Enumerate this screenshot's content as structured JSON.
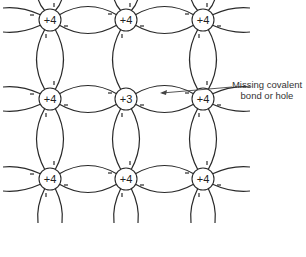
{
  "diagram": {
    "title": "",
    "atoms": [
      {
        "row": 0,
        "col": 0,
        "label": "+4"
      },
      {
        "row": 0,
        "col": 1,
        "label": "+4"
      },
      {
        "row": 0,
        "col": 2,
        "label": "+4"
      },
      {
        "row": 1,
        "col": 0,
        "label": "+4"
      },
      {
        "row": 1,
        "col": 1,
        "label": "+3"
      },
      {
        "row": 1,
        "col": 2,
        "label": "+4"
      },
      {
        "row": 2,
        "col": 0,
        "label": "+4"
      },
      {
        "row": 2,
        "col": 1,
        "label": "+4"
      },
      {
        "row": 2,
        "col": 2,
        "label": "+4"
      }
    ],
    "annotation": {
      "line1": "Missing covalent",
      "line2": "bond or hole"
    },
    "colors": {
      "stroke": "#2a2a2a",
      "text": "#333333",
      "background": "#ffffff"
    }
  }
}
